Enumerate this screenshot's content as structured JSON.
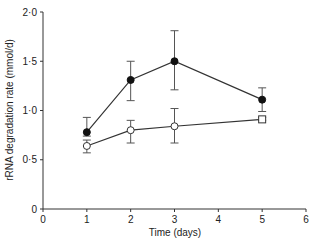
{
  "chart_data": {
    "type": "line",
    "title": "",
    "xlabel": "Time (days)",
    "ylabel": "rRNA degradation rate (mmol/d)",
    "xlim": [
      0,
      6
    ],
    "ylim": [
      0,
      2.0
    ],
    "x_ticks": [
      "0",
      "1",
      "2",
      "3",
      "4",
      "5",
      "6"
    ],
    "y_ticks": [
      "0",
      "0·5",
      "1·0",
      "1·5",
      "2·0"
    ],
    "grid": false,
    "legend": null,
    "series": [
      {
        "name": "filled circles",
        "marker": "filled-circle",
        "x": [
          1,
          2,
          3,
          5
        ],
        "y": [
          0.78,
          1.31,
          1.5,
          1.11
        ],
        "error_upper": [
          0.93,
          1.5,
          1.81,
          1.23
        ],
        "error_lower": [
          0.74,
          1.1,
          1.21,
          0.99
        ]
      },
      {
        "name": "open circles",
        "marker": "open-circle",
        "x": [
          1,
          2,
          3,
          5
        ],
        "y": [
          0.64,
          0.8,
          0.84,
          0.91
        ],
        "error_upper": [
          0.7,
          0.9,
          1.02,
          0.93
        ],
        "error_lower": [
          0.57,
          0.67,
          0.67,
          0.9
        ]
      }
    ]
  }
}
